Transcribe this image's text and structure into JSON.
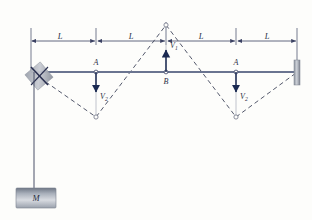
{
  "figure": {
    "background_color": "#fdfdfb"
  },
  "colors": {
    "beam": "#6a7490",
    "arrow": "#1b2a52",
    "dashed_curve": "#4a4f63",
    "dimension_line": "#3b4263",
    "light_guide": "#b9bcc6",
    "support_fill": "#8e949f",
    "mass_fill": "#8f96a3",
    "label_text": "#2a2f45"
  },
  "dimensions": {
    "label": "L",
    "segments": [
      {
        "name": "segment-1",
        "label": "L"
      },
      {
        "name": "segment-2",
        "label": "L"
      },
      {
        "name": "segment-3",
        "label": "L"
      },
      {
        "name": "segment-4",
        "label": "L"
      }
    ],
    "count": 4
  },
  "nodes": [
    {
      "id": "node-a-left",
      "label": "A",
      "x": 96,
      "y": 72
    },
    {
      "id": "node-b-center",
      "label": "B",
      "x": 166,
      "y": 72
    },
    {
      "id": "node-a-right",
      "label": "A",
      "x": 236,
      "y": 72
    }
  ],
  "forces": [
    {
      "id": "force-v2-left",
      "label": "V",
      "subscript": "2",
      "direction": "down",
      "at_node": "A"
    },
    {
      "id": "force-v1-center",
      "label": "V",
      "subscript": "1",
      "direction": "up",
      "at_node": "B"
    },
    {
      "id": "force-v2-right",
      "label": "V",
      "subscript": "2",
      "direction": "down",
      "at_node": "A"
    }
  ],
  "mass": {
    "label": "M",
    "description": "hanging-mass-block"
  },
  "supports": {
    "left": {
      "type": "pin-hatched-support",
      "label": ""
    },
    "right": {
      "type": "fixed-wall-support",
      "label": ""
    }
  },
  "deflection_curve": {
    "style": "dashed",
    "apex_points": [
      {
        "name": "trough-left",
        "x": 96,
        "y": 117
      },
      {
        "name": "crest-center",
        "x": 166,
        "y": 25
      },
      {
        "name": "trough-right",
        "x": 236,
        "y": 117
      }
    ]
  }
}
